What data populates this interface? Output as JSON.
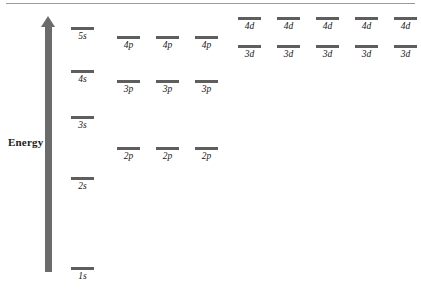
{
  "figure": {
    "axis_label": "Energy",
    "bar_color": "#5e5e5e",
    "arrow_color": "#6b6b6b",
    "rule_color": "#9a9a9a"
  },
  "chart_data": {
    "type": "diagram",
    "ylabel": "Energy",
    "grid": false,
    "legend": null,
    "note": "Relative orbital energies; y position is energy (higher = greater energy). Each bar is one orbital.",
    "levels": [
      {
        "label": "1s",
        "subshell": "s",
        "column": 0,
        "x": 71,
        "y": 267
      },
      {
        "label": "2s",
        "subshell": "s",
        "column": 0,
        "x": 71,
        "y": 177
      },
      {
        "label": "3s",
        "subshell": "s",
        "column": 0,
        "x": 71,
        "y": 116
      },
      {
        "label": "4s",
        "subshell": "s",
        "column": 0,
        "x": 71,
        "y": 70
      },
      {
        "label": "5s",
        "subshell": "s",
        "column": 0,
        "x": 71,
        "y": 27
      },
      {
        "label": "2p",
        "subshell": "p",
        "column": 1,
        "x": 117,
        "y": 147
      },
      {
        "label": "2p",
        "subshell": "p",
        "column": 2,
        "x": 156,
        "y": 147
      },
      {
        "label": "2p",
        "subshell": "p",
        "column": 3,
        "x": 195,
        "y": 147
      },
      {
        "label": "3p",
        "subshell": "p",
        "column": 1,
        "x": 117,
        "y": 80
      },
      {
        "label": "3p",
        "subshell": "p",
        "column": 2,
        "x": 156,
        "y": 80
      },
      {
        "label": "3p",
        "subshell": "p",
        "column": 3,
        "x": 195,
        "y": 80
      },
      {
        "label": "4p",
        "subshell": "p",
        "column": 1,
        "x": 117,
        "y": 36
      },
      {
        "label": "4p",
        "subshell": "p",
        "column": 2,
        "x": 156,
        "y": 36
      },
      {
        "label": "4p",
        "subshell": "p",
        "column": 3,
        "x": 195,
        "y": 36
      },
      {
        "label": "3d",
        "subshell": "d",
        "column": 4,
        "x": 238,
        "y": 45
      },
      {
        "label": "3d",
        "subshell": "d",
        "column": 5,
        "x": 277,
        "y": 45
      },
      {
        "label": "3d",
        "subshell": "d",
        "column": 6,
        "x": 316,
        "y": 45
      },
      {
        "label": "3d",
        "subshell": "d",
        "column": 7,
        "x": 355,
        "y": 45
      },
      {
        "label": "3d",
        "subshell": "d",
        "column": 8,
        "x": 394,
        "y": 45
      },
      {
        "label": "4d",
        "subshell": "d",
        "column": 4,
        "x": 238,
        "y": 17
      },
      {
        "label": "4d",
        "subshell": "d",
        "column": 5,
        "x": 277,
        "y": 17
      },
      {
        "label": "4d",
        "subshell": "d",
        "column": 6,
        "x": 316,
        "y": 17
      },
      {
        "label": "4d",
        "subshell": "d",
        "column": 7,
        "x": 355,
        "y": 17
      },
      {
        "label": "4d",
        "subshell": "d",
        "column": 8,
        "x": 394,
        "y": 17
      }
    ]
  }
}
